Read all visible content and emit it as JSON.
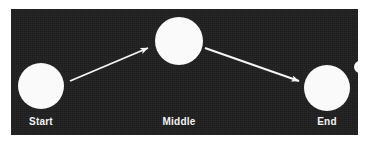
{
  "diagram": {
    "title": "",
    "background_color": "#1e1e1e",
    "node_color": "#fafafa",
    "edge_color": "#f5f5f5",
    "label_color": "#f2f2f2",
    "nodes": [
      {
        "id": "start",
        "label": "Start",
        "shape": "circle",
        "cx": 30,
        "cy": 77,
        "r": 23,
        "label_x": 30,
        "label_y": 107
      },
      {
        "id": "middle",
        "label": "Middle",
        "shape": "circle",
        "cx": 168,
        "cy": 32,
        "r": 24,
        "label_x": 168,
        "label_y": 107
      },
      {
        "id": "end",
        "label": "End",
        "shape": "circle",
        "cx": 316,
        "cy": 79,
        "r": 23,
        "label_x": 316,
        "label_y": 107
      },
      {
        "id": "ghost-right",
        "label": "",
        "shape": "circle",
        "cx": 348,
        "cy": 58,
        "r": 6,
        "label_x": 348,
        "label_y": 107
      }
    ],
    "edges": [
      {
        "id": "start-to-middle",
        "from": "start",
        "to": "middle",
        "x1": 59,
        "y1": 72,
        "x2": 139,
        "y2": 39,
        "arrowhead": "filled-triangle"
      },
      {
        "id": "middle-to-end",
        "from": "middle",
        "to": "end",
        "x1": 194,
        "y1": 39,
        "x2": 290,
        "y2": 73,
        "arrowhead": "filled-triangle"
      }
    ]
  }
}
